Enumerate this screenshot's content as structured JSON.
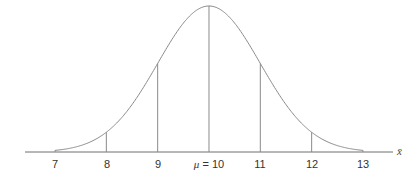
{
  "chart_data": {
    "type": "line",
    "title": "",
    "xlabel": "x̄",
    "ylabel": "",
    "mean": 10,
    "sd": 1,
    "xlim": [
      6.1,
      13.6
    ],
    "x_ticks": [
      7,
      8,
      9,
      10,
      11,
      12,
      13
    ],
    "tick_labels": [
      "7",
      "8",
      "9",
      "μ = 10",
      "11",
      "12",
      "13"
    ],
    "vertical_lines_at": [
      7,
      8,
      9,
      10,
      11,
      12,
      13
    ],
    "curve_domain": [
      7,
      13
    ],
    "grid": false,
    "legend": null
  },
  "labels": {
    "t7": "7",
    "t8": "8",
    "t9": "9",
    "mu_symbol": "μ",
    "mu_eq": " = 10",
    "t11": "11",
    "t12": "12",
    "t13": "13",
    "xaxis": "x̄"
  },
  "colors": {
    "line": "#8a8a8a",
    "axis": "#6e6e6e",
    "text": "#333333"
  }
}
